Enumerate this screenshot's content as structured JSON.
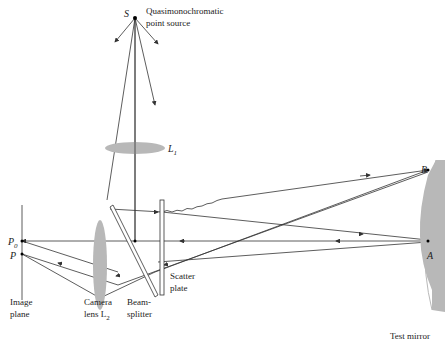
{
  "labels": {
    "source_symbol": "S",
    "source_line1": "Quasimonochromatic",
    "source_line2": "point source",
    "lens1_symbol": "L",
    "lens1_sub": "1",
    "point_b": "B",
    "point_a": "A",
    "point_p0": "P",
    "point_p0_sub": "0",
    "point_p": "P",
    "image_plane_line1": "Image",
    "image_plane_line2": "plane",
    "camera_lens_line1": "Camera",
    "camera_lens_line2": "lens L",
    "camera_lens_sub": "2",
    "beamsplitter_line1": "Beam-",
    "beamsplitter_line2": "splitter",
    "scatter_plate_line1": "Scatter",
    "scatter_plate_line2": "plate",
    "test_mirror": "Test mirror"
  },
  "colors": {
    "line": "#333333",
    "optic_fill": "#b8b8b8"
  }
}
